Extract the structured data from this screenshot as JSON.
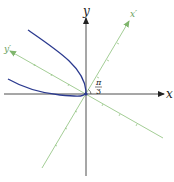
{
  "diagram": {
    "axes": {
      "x_label": "x",
      "y_label": "y",
      "x_prime_label": "x′",
      "y_prime_label": "y′"
    },
    "angle": {
      "numerator": "π",
      "denominator": "3"
    },
    "colors": {
      "axis": "#222222",
      "rotated_axis": "#8cc07a",
      "curve": "#2b3a8f"
    }
  }
}
